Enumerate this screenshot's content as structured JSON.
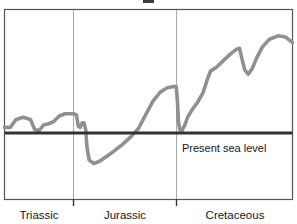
{
  "chart_data": {
    "type": "line",
    "title": "",
    "xlabel": "",
    "ylabel": "",
    "xlim": [
      0,
      100
    ],
    "ylim": [
      -40,
      100
    ],
    "grid": false,
    "legend": null,
    "categories": [
      "Triassic",
      "Jurassic",
      "Cretaceous"
    ],
    "period_boundaries": [
      0,
      24,
      60,
      100
    ],
    "reference_line": {
      "label": "Present sea level",
      "value": 0,
      "color": "#333333"
    },
    "series": [
      {
        "name": "Relative sea level",
        "color": "#909090",
        "points": [
          {
            "x": 0.0,
            "y": 5
          },
          {
            "x": 2.0,
            "y": 5
          },
          {
            "x": 4.0,
            "y": 12
          },
          {
            "x": 6.5,
            "y": 14
          },
          {
            "x": 9.0,
            "y": 12
          },
          {
            "x": 10.5,
            "y": 3
          },
          {
            "x": 12.0,
            "y": 2
          },
          {
            "x": 13.5,
            "y": 7
          },
          {
            "x": 15.0,
            "y": 8
          },
          {
            "x": 17.0,
            "y": 10
          },
          {
            "x": 19.0,
            "y": 15
          },
          {
            "x": 21.0,
            "y": 17
          },
          {
            "x": 24.0,
            "y": 17
          },
          {
            "x": 25.0,
            "y": 16
          },
          {
            "x": 25.6,
            "y": 6
          },
          {
            "x": 26.3,
            "y": 5
          },
          {
            "x": 27.0,
            "y": 9
          },
          {
            "x": 27.6,
            "y": 9
          },
          {
            "x": 28.2,
            "y": 3
          },
          {
            "x": 28.6,
            "y": -12
          },
          {
            "x": 29.4,
            "y": -24
          },
          {
            "x": 31.0,
            "y": -27
          },
          {
            "x": 33.0,
            "y": -25
          },
          {
            "x": 37.0,
            "y": -18
          },
          {
            "x": 41.0,
            "y": -10
          },
          {
            "x": 44.0,
            "y": -3
          },
          {
            "x": 46.5,
            "y": 4
          },
          {
            "x": 49.0,
            "y": 16
          },
          {
            "x": 51.5,
            "y": 28
          },
          {
            "x": 54.0,
            "y": 36
          },
          {
            "x": 56.5,
            "y": 40
          },
          {
            "x": 58.5,
            "y": 41
          },
          {
            "x": 59.6,
            "y": 41
          },
          {
            "x": 60.0,
            "y": 30
          },
          {
            "x": 60.4,
            "y": 10
          },
          {
            "x": 60.9,
            "y": 3
          },
          {
            "x": 61.6,
            "y": 2
          },
          {
            "x": 62.6,
            "y": 7
          },
          {
            "x": 63.6,
            "y": 14
          },
          {
            "x": 65.0,
            "y": 20
          },
          {
            "x": 67.0,
            "y": 27
          },
          {
            "x": 69.0,
            "y": 36
          },
          {
            "x": 70.5,
            "y": 48
          },
          {
            "x": 71.6,
            "y": 55
          },
          {
            "x": 73.5,
            "y": 58
          },
          {
            "x": 76.0,
            "y": 64
          },
          {
            "x": 78.5,
            "y": 70
          },
          {
            "x": 80.5,
            "y": 74
          },
          {
            "x": 81.6,
            "y": 75
          },
          {
            "x": 82.4,
            "y": 66
          },
          {
            "x": 83.4,
            "y": 56
          },
          {
            "x": 84.6,
            "y": 52
          },
          {
            "x": 86.0,
            "y": 57
          },
          {
            "x": 87.5,
            "y": 66
          },
          {
            "x": 89.5,
            "y": 76
          },
          {
            "x": 92.0,
            "y": 83
          },
          {
            "x": 95.0,
            "y": 86
          },
          {
            "x": 97.5,
            "y": 85
          },
          {
            "x": 100.0,
            "y": 80
          }
        ]
      }
    ]
  },
  "axis": {
    "labels": [
      {
        "name": "triassic",
        "text": "Triassic"
      },
      {
        "name": "jurassic",
        "text": "Jurassic"
      },
      {
        "name": "cretaceous",
        "text": "Cretaceous"
      }
    ]
  },
  "annotations": {
    "sea_level_label": "Present sea level"
  },
  "colors": {
    "curve": "#909090",
    "sea_level_line": "#333333",
    "frame": "#555555",
    "divider": "#aaaaaa",
    "text": "#171717",
    "background": "#ffffff"
  }
}
